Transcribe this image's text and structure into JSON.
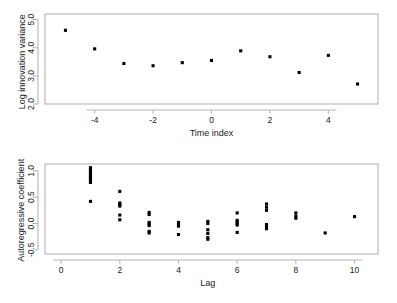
{
  "figure": {
    "background_color": "#ffffff",
    "frame_color": "#b4b4b4",
    "point_color": "#000000",
    "text_color": "#1a1a1a"
  },
  "chart_data": [
    {
      "type": "scatter",
      "panel": "top",
      "title": "",
      "xlabel": "Time index",
      "ylabel": "Log innovation variance",
      "xlim": [
        -5.7,
        5.7
      ],
      "ylim": [
        2.0,
        5.2
      ],
      "xticks": [
        -4,
        -2,
        0,
        2,
        4
      ],
      "xtick_labels": [
        "-4",
        "-2",
        "0",
        "2",
        "4"
      ],
      "yticks": [
        2.0,
        3.0,
        4.0,
        5.0
      ],
      "ytick_labels": [
        "2.0",
        "3.0",
        "4.0",
        "5.0"
      ],
      "grid": false,
      "legend": false,
      "x": [
        -5,
        -4,
        -3,
        -2,
        -1,
        0,
        1,
        2,
        3,
        4,
        5
      ],
      "y": [
        4.62,
        3.96,
        3.44,
        3.36,
        3.47,
        3.55,
        3.89,
        3.68,
        3.12,
        3.73,
        2.71
      ]
    },
    {
      "type": "scatter",
      "panel": "bottom",
      "title": "",
      "xlabel": "Lag",
      "ylabel": "Autoregressive coefficient",
      "xlim": [
        -0.55,
        10.8
      ],
      "ylim": [
        -0.58,
        1.13
      ],
      "xticks": [
        0,
        2,
        4,
        6,
        8,
        10
      ],
      "xtick_labels": [
        "0",
        "2",
        "4",
        "6",
        "8",
        "10"
      ],
      "yticks": [
        -0.5,
        0.0,
        0.5,
        1.0
      ],
      "ytick_labels": [
        "-0.5",
        "0.0",
        "0.5",
        "1.0"
      ],
      "grid": false,
      "legend": false,
      "points": [
        [
          1,
          1.06
        ],
        [
          1,
          1.02
        ],
        [
          1,
          0.99
        ],
        [
          1,
          0.96
        ],
        [
          1,
          0.93
        ],
        [
          1,
          0.9
        ],
        [
          1,
          0.87
        ],
        [
          1,
          0.84
        ],
        [
          1,
          0.81
        ],
        [
          1,
          0.78
        ],
        [
          1,
          0.42
        ],
        [
          2,
          0.61
        ],
        [
          2,
          0.39
        ],
        [
          2,
          0.36
        ],
        [
          2,
          0.33
        ],
        [
          2,
          0.16
        ],
        [
          2,
          0.07
        ],
        [
          3,
          0.21
        ],
        [
          3,
          0.17
        ],
        [
          3,
          0.02
        ],
        [
          3,
          -0.01
        ],
        [
          3,
          -0.04
        ],
        [
          3,
          -0.15
        ],
        [
          3,
          -0.18
        ],
        [
          4,
          0.02
        ],
        [
          4,
          -0.02
        ],
        [
          4,
          -0.05
        ],
        [
          4,
          -0.21
        ],
        [
          5,
          0.04
        ],
        [
          5,
          0.0
        ],
        [
          5,
          -0.12
        ],
        [
          5,
          -0.19
        ],
        [
          5,
          -0.27
        ],
        [
          5,
          -0.3
        ],
        [
          6,
          0.2
        ],
        [
          6,
          0.06
        ],
        [
          6,
          0.03
        ],
        [
          6,
          0.0
        ],
        [
          6,
          -0.03
        ],
        [
          6,
          -0.17
        ],
        [
          7,
          0.37
        ],
        [
          7,
          0.31
        ],
        [
          7,
          0.25
        ],
        [
          7,
          -0.02
        ],
        [
          7,
          -0.06
        ],
        [
          7,
          -0.1
        ],
        [
          8,
          0.2
        ],
        [
          8,
          0.14
        ],
        [
          8,
          0.1
        ],
        [
          9,
          -0.18
        ],
        [
          10,
          0.13
        ]
      ]
    }
  ]
}
